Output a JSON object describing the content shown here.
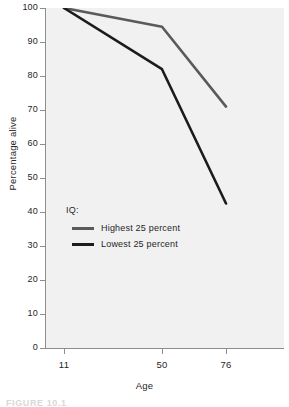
{
  "chart_data": {
    "type": "line",
    "title": "",
    "xlabel": "Age",
    "ylabel": "Percentage alive",
    "categories": [
      "11",
      "50",
      "76"
    ],
    "x": [
      11,
      50,
      76
    ],
    "xlim": [
      0,
      3
    ],
    "ylim": [
      0,
      100
    ],
    "ytick_labels": [
      "100",
      "90",
      "80",
      "70",
      "60",
      "50",
      "40",
      "30",
      "20",
      "10",
      "0"
    ],
    "ytick_values": [
      100,
      90,
      80,
      70,
      60,
      50,
      40,
      30,
      20,
      10,
      0
    ],
    "xtick_labels": [
      "11",
      "50",
      "76"
    ],
    "grid": false,
    "legend_position": "inside-left-center",
    "legend_title": "IQ:",
    "plot_background": "#f1f1f1",
    "axis_color": "#8d8d8d",
    "series": [
      {
        "name": "Highest 25 percent",
        "values": [
          100,
          94.5,
          71
        ],
        "color": "#5a5a5a"
      },
      {
        "name": "Lowest 25 percent",
        "values": [
          100,
          82,
          42.5
        ],
        "color": "#1c1c1c"
      }
    ]
  },
  "axes": {
    "y_title": "Percentage alive",
    "x_title": "Age"
  },
  "legend": {
    "title": "IQ:",
    "entries": [
      {
        "label": "Highest 25 percent",
        "color": "#5a5a5a"
      },
      {
        "label": "Lowest 25 percent",
        "color": "#1c1c1c"
      }
    ]
  },
  "caption": {
    "text": "FIGURE 10.1"
  }
}
